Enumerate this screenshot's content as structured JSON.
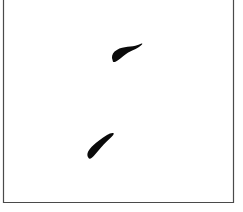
{
  "image": {
    "width": 243,
    "height": 212,
    "background_color": "#ffffff",
    "description": "Scanned black-and-white figure showing two small solid black elongated marks inside a thin rectangular frame",
    "caption": ""
  },
  "frame": {
    "name": "rectangular-border",
    "stroke_color": "#4a4a4a",
    "stroke_width": 1.2,
    "left_x": 3.5,
    "right_x": 233.5,
    "bottom_y": 202.5,
    "top_y": -2,
    "top_edge_visible": false,
    "fill": "none"
  },
  "shapes": [
    {
      "id": "blob-upper",
      "label": "upper-mark",
      "color": "#0a0a0a",
      "bbox": {
        "x": 112,
        "y": 43,
        "width": 30,
        "height": 20
      },
      "centroid": {
        "x": 124,
        "y": 54
      },
      "orientation_deg": -18,
      "description": "Comma-shaped mark, thick rounded bulb at lower-left tapering to a fine point at upper-right",
      "path": "M112.6,60.2 C111.3,57.4 112.0,54.0 114.6,51.6 C117.4,49.0 121.2,47.6 124.8,47.2 C128.6,46.8 132.2,46.5 135.4,45.8 C137.6,45.3 139.6,44.4 141.5,43.6 C142.2,43.3 142.6,43.9 142.0,44.5 C140.2,46.3 138.0,47.7 135.6,48.9 C133.0,50.2 130.4,51.2 128.2,52.4 C126.4,53.4 125.0,54.6 123.4,55.9 C121.4,57.5 119.4,59.2 117.2,60.7 C115.8,61.7 114.3,62.4 113.4,62.0 C112.9,61.8 112.7,61.0 112.6,60.2 Z"
    },
    {
      "id": "blob-lower",
      "label": "lower-mark",
      "color": "#0a0a0a",
      "bbox": {
        "x": 87,
        "y": 133,
        "width": 27,
        "height": 26
      },
      "centroid": {
        "x": 100,
        "y": 147
      },
      "orientation_deg": -42,
      "description": "Elongated diagonal mark running lower-left to upper-right, blunt rounded end at lower-left tapering to a point at upper-right",
      "path": "M88.4,157.8 C86.6,155.4 87.4,152.0 89.8,149.0 C92.2,146.0 95.4,143.4 98.4,141.0 C101.4,138.6 104.2,136.6 107.0,135.0 C109.4,133.6 111.6,132.6 113.2,133.0 C113.9,133.2 113.9,134.0 113.2,134.9 C111.6,137.0 109.4,138.9 107.2,141.0 C104.8,143.3 102.6,145.6 100.4,148.2 C98.2,150.8 96.2,153.4 94.2,155.6 C92.6,157.4 91.0,158.8 89.8,158.8 C89.1,158.8 88.7,158.4 88.4,157.8 Z"
    }
  ]
}
